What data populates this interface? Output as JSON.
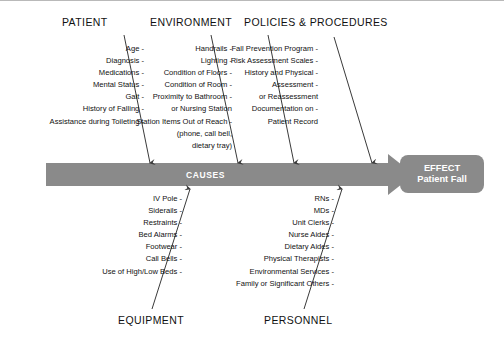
{
  "diagram": {
    "type": "fishbone-ishikawa",
    "spine_label": "CAUSES",
    "effect": {
      "title": "EFFECT",
      "subtitle": "Patient Fall"
    },
    "colors": {
      "spine": "#8a8a8a",
      "effect_box": "#8a8a8a",
      "bone_line": "#3a3a3a",
      "text": "#111111",
      "background": "#ffffff"
    },
    "categories_top": [
      {
        "name": "PATIENT",
        "causes": [
          "Age -",
          "Diagnosis -",
          "Medications -",
          "Mental Status -",
          "Gait -",
          "History of Falling -",
          "Assistance during Toileting -"
        ]
      },
      {
        "name": "ENVIRONMENT",
        "causes": [
          "Handrails -",
          "Lighting -",
          "Condition of Floors -",
          "Condition of Room -",
          "Proximity to Bathroom -",
          "or Nursing Station",
          "Station Items Out of Reach -",
          "(phone, call bell,",
          "dietary tray)"
        ]
      },
      {
        "name": "POLICIES & PROCEDURES",
        "causes": [
          "Fall Prevention Program -",
          "Risk Assessment Scales -",
          "History and Physical -",
          "Assessment -",
          "or Reassessment",
          "Documentation on -",
          "Patient Record"
        ]
      }
    ],
    "categories_bottom": [
      {
        "name": "EQUIPMENT",
        "causes": [
          "IV Pole -",
          "Siderails -",
          "Restraints -",
          "Bed Alarms -",
          "Footwear -",
          "Call Bells -",
          "Use of High/Low Beds -"
        ]
      },
      {
        "name": "PERSONNEL",
        "causes": [
          "RNs -",
          "MDs -",
          "Unit Clerks -",
          "Nurse Aides -",
          "Dietary Aides -",
          "Physical Therapists -",
          "Environmental Services -",
          "Family or Significant Others -"
        ]
      }
    ]
  }
}
